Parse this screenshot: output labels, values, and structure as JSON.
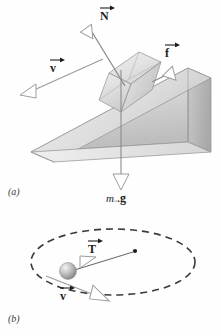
{
  "figure": {
    "type": "physics-free-body-diagram",
    "background_color": "#ffffff",
    "ink_color": "#2b2b2b",
    "panels": [
      {
        "id": "a",
        "id_label": "(a)",
        "caption": "Block sliding down an inclined plane (wedge) with free-body force vectors",
        "objects": [
          "inclined-plane-wedge",
          "translucent-cube-block"
        ],
        "vectors": [
          {
            "name": "normal-force",
            "label": "N",
            "arrow_over": true,
            "direction": "up-left perpendicular to incline surface"
          },
          {
            "name": "friction-force",
            "label": "f",
            "arrow_over": true,
            "direction": "up along incline"
          },
          {
            "name": "velocity",
            "label": "v",
            "arrow_over": true,
            "direction": "down along incline to the lower-left"
          },
          {
            "name": "weight",
            "label": "mg",
            "arrow_over": true,
            "prefix": "m",
            "bold": "g",
            "direction": "straight down"
          }
        ]
      },
      {
        "id": "b",
        "id_label": "(b)",
        "caption": "Ball in uniform circular motion on a horizontal dashed circle",
        "objects": [
          "dashed-circle-orbit",
          "gray-sphere-ball",
          "center-dot"
        ],
        "vectors": [
          {
            "name": "tension",
            "label": "T",
            "arrow_over": true,
            "direction": "toward the center of the circle"
          },
          {
            "name": "velocity",
            "label": "v",
            "arrow_over": true,
            "direction": "tangent to the circle, toward lower-right"
          }
        ]
      }
    ]
  },
  "labels": {
    "normal_N": "N",
    "friction_f": "f",
    "velocity_v_a": "v",
    "weight_m": "m",
    "weight_g": "g",
    "tension_T": "T",
    "velocity_v_b": "v",
    "panel_a": "(a)",
    "panel_b": "(b)"
  },
  "colors": {
    "ink": "#2b2b2b",
    "line": "#9a9a9a",
    "wedge_top_light": "#e9e9e9",
    "wedge_face_mid": "#cfcfcf",
    "wedge_face_dark": "#b5b5b5",
    "cube_light": "#ededed",
    "cube_mid": "#dcdcdc",
    "cube_dark": "#c6c6c6",
    "sphere_light": "#efefef",
    "sphere_dark": "#8e8e8e",
    "dash": "#3a3a3a"
  }
}
